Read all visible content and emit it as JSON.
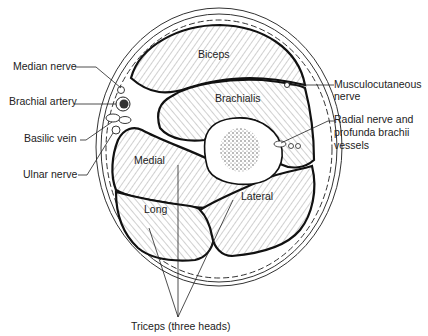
{
  "figure": {
    "colors": {
      "ink": "#222222",
      "background": "#ffffff",
      "outline": "#111111"
    }
  },
  "muscles": {
    "biceps": "Biceps",
    "brachialis": "Brachialis",
    "medial": "Medial",
    "long": "Long",
    "lateral": "Lateral"
  },
  "labels": {
    "median_nerve": "Median nerve",
    "brachial_artery": "Brachial artery",
    "basilic_vein": "Basilic vein",
    "ulnar_nerve": "Ulnar nerve",
    "musculocutaneous_1": "Musculocutaneous",
    "musculocutaneous_2": "nerve",
    "radial_1": "Radial nerve and",
    "radial_2": "profunda brachii",
    "radial_3": "vessels",
    "triceps": "Triceps (three heads)"
  }
}
